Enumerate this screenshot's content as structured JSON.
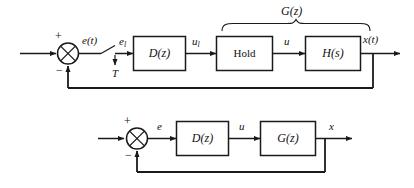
{
  "figure": {
    "line_color": "#1a1a1a",
    "background": "#ffffff"
  },
  "upper_diagram": {
    "name": "sampled-data-control-loop",
    "input_arrow": "input",
    "sum_junction": {
      "plus_sign": "+",
      "minus_sign": "−",
      "glyph": "✕"
    },
    "signals": {
      "error_continuous": "e(t)",
      "error_sampled_base": "e",
      "error_sampled_sub": "l",
      "control_sampled_base": "u",
      "control_sampled_sub": "l",
      "control_hold": "u",
      "output": "x(t)",
      "sample_period": "T"
    },
    "blocks": [
      {
        "label": "D(z)",
        "style": "italic"
      },
      {
        "label": "Hold",
        "style": "plain"
      },
      {
        "label": "H(s)",
        "style": "italic"
      }
    ],
    "brace_label": "G(z)"
  },
  "lower_diagram": {
    "name": "discrete-equivalent-loop",
    "input_arrow": "input",
    "sum_junction": {
      "plus_sign": "+",
      "minus_sign": "−",
      "glyph": "✕"
    },
    "signals": {
      "error": "e",
      "control": "u",
      "output": "x"
    },
    "blocks": [
      {
        "label": "D(z)",
        "style": "italic"
      },
      {
        "label": "G(z)",
        "style": "italic"
      }
    ]
  }
}
